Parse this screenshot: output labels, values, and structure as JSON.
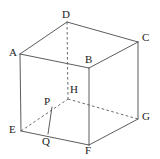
{
  "figure": {
    "type": "geometry-diagram",
    "canvas": {
      "width": 160,
      "height": 159,
      "background": "#ffffff"
    },
    "styles": {
      "solid_edge_color": "#4a4a4a",
      "dashed_edge_color": "#5a5a5a",
      "label_color": "#1a1a1a",
      "stroke_width": 0.9
    },
    "vertices": [
      {
        "name": "A",
        "label": "A",
        "x": 20,
        "y": 54,
        "label_x": 9,
        "label_y": 47
      },
      {
        "name": "B",
        "label": "B",
        "x": 89,
        "y": 68,
        "label_x": 85,
        "label_y": 54
      },
      {
        "name": "C",
        "label": "C",
        "x": 138,
        "y": 42,
        "label_x": 142,
        "label_y": 32
      },
      {
        "name": "D",
        "label": "D",
        "x": 67,
        "y": 22,
        "label_x": 62,
        "label_y": 9
      },
      {
        "name": "E",
        "label": "E",
        "x": 21,
        "y": 131,
        "label_x": 9,
        "label_y": 124
      },
      {
        "name": "F",
        "label": "F",
        "x": 89,
        "y": 145,
        "label_x": 85,
        "label_y": 145
      },
      {
        "name": "G",
        "label": "G",
        "x": 138,
        "y": 119,
        "label_x": 142,
        "label_y": 111
      },
      {
        "name": "H",
        "label": "H",
        "x": 68,
        "y": 99,
        "label_x": 70,
        "label_y": 84
      },
      {
        "name": "P",
        "label": "P",
        "x": 52,
        "y": 107,
        "label_x": 44,
        "label_y": 96
      },
      {
        "name": "Q",
        "label": "Q",
        "x": 48,
        "y": 134,
        "label_x": 42,
        "label_y": 136
      }
    ],
    "edges_solid": [
      {
        "name": "edge-A-D",
        "from": "A",
        "to": "D"
      },
      {
        "name": "edge-D-C",
        "from": "D",
        "to": "C"
      },
      {
        "name": "edge-A-B",
        "from": "A",
        "to": "B"
      },
      {
        "name": "edge-B-C",
        "from": "B",
        "to": "C"
      },
      {
        "name": "edge-A-E",
        "from": "A",
        "to": "E"
      },
      {
        "name": "edge-B-F",
        "from": "B",
        "to": "F"
      },
      {
        "name": "edge-C-G",
        "from": "C",
        "to": "G"
      },
      {
        "name": "edge-E-F",
        "from": "E",
        "to": "F"
      },
      {
        "name": "edge-F-G",
        "from": "F",
        "to": "G"
      },
      {
        "name": "edge-P-Q",
        "from": "P",
        "to": "Q"
      }
    ],
    "edges_dashed": [
      {
        "name": "edge-D-H",
        "from": "D",
        "to": "H"
      },
      {
        "name": "edge-E-H",
        "from": "E",
        "to": "H"
      },
      {
        "name": "edge-H-G",
        "from": "H",
        "to": "G"
      }
    ]
  }
}
